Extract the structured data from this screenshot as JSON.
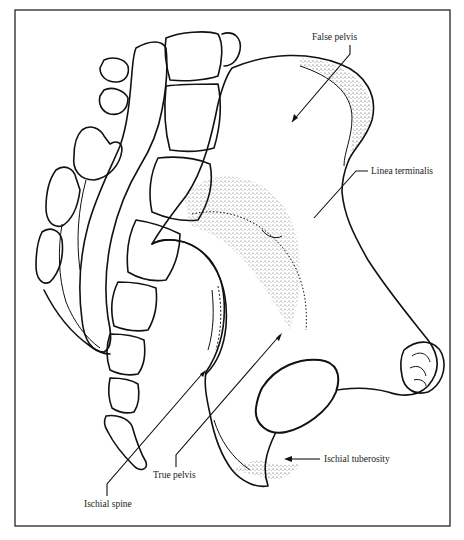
{
  "figure": {
    "frame_color": "#333333",
    "ink_color": "#111111",
    "background_color": "#ffffff"
  },
  "labels": {
    "false_pelvis": "False pelvis",
    "linea_terminalis": "Linea terminalis",
    "ischial_tuberosity": "Ischial tuberosity",
    "true_pelvis": "True pelvis",
    "ischial_spine": "Ischial spine"
  }
}
